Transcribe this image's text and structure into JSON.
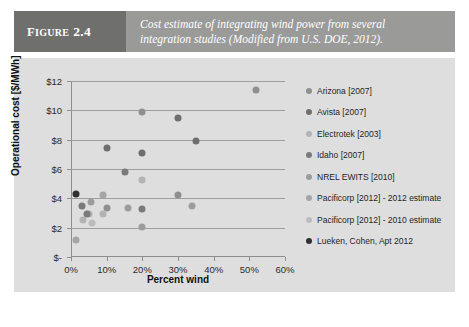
{
  "figure": {
    "tag_prefix": "F",
    "tag_word": "IGURE",
    "tag_number": "2.4",
    "caption_line1": "Cost estimate of integrating wind power from several",
    "caption_line2": "integration studies (Modified from U.S. DOE, 2012)."
  },
  "chart_data": {
    "type": "scatter",
    "title": "",
    "xlabel": "Percent wind",
    "ylabel": "Operational cost [$/MWh]",
    "xlim": [
      0,
      60
    ],
    "ylim": [
      0,
      12
    ],
    "grid": true,
    "legend_position": "right",
    "xtick_labels": [
      "0%",
      "10%",
      "20%",
      "30%",
      "40%",
      "50%",
      "60%"
    ],
    "xtick_values": [
      0,
      10,
      20,
      30,
      40,
      50,
      60
    ],
    "ytick_labels": [
      "$-",
      "$2",
      "$4",
      "$6",
      "$8",
      "$10",
      "$12"
    ],
    "ytick_values": [
      0,
      2,
      4,
      6,
      8,
      10,
      12
    ],
    "series": [
      {
        "name": "Arizona [2007]",
        "color": "#8f8f8f",
        "points": [
          {
            "x": 10,
            "y": 3.35
          },
          {
            "x": 20,
            "y": 9.9
          },
          {
            "x": 30,
            "y": 4.25
          },
          {
            "x": 52,
            "y": 11.4
          }
        ]
      },
      {
        "name": "Avista [2007]",
        "color": "#6e6e6e",
        "points": [
          {
            "x": 10,
            "y": 7.45
          },
          {
            "x": 20,
            "y": 7.1
          },
          {
            "x": 30,
            "y": 9.5
          },
          {
            "x": 35,
            "y": 7.9
          }
        ]
      },
      {
        "name": "Electrotek [2003]",
        "color": "#b3b3b3",
        "points": [
          {
            "x": 3.5,
            "y": 2.5
          },
          {
            "x": 5,
            "y": 2.9
          },
          {
            "x": 9,
            "y": 2.9
          },
          {
            "x": 20,
            "y": 5.25
          }
        ]
      },
      {
        "name": "Idaho [2007]",
        "color": "#7a7a7a",
        "points": [
          {
            "x": 3,
            "y": 3.5
          },
          {
            "x": 4.5,
            "y": 2.95
          },
          {
            "x": 15,
            "y": 5.8
          },
          {
            "x": 20,
            "y": 3.25
          }
        ]
      },
      {
        "name": "NREL EWITS [2010]",
        "color": "#9c9c9c",
        "points": [
          {
            "x": 5.5,
            "y": 3.75
          },
          {
            "x": 16,
            "y": 3.35
          },
          {
            "x": 20,
            "y": 2.05
          },
          {
            "x": 34,
            "y": 3.45
          }
        ]
      },
      {
        "name": "Pacificorp [2012] - 2012 estimate",
        "color": "#a5a5a5",
        "points": [
          {
            "x": 1.5,
            "y": 1.15
          },
          {
            "x": 9,
            "y": 4.2
          }
        ]
      },
      {
        "name": "Pacificorp [2012] - 2010 estimate",
        "color": "#bcbcbc",
        "points": [
          {
            "x": 6,
            "y": 2.35
          }
        ]
      },
      {
        "name": "Lueken, Cohen, Apt 2012",
        "color": "#303030",
        "points": [
          {
            "x": 1.5,
            "y": 4.3
          }
        ]
      }
    ]
  }
}
